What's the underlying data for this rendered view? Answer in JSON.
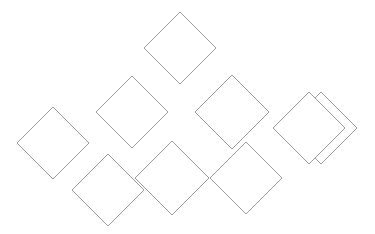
{
  "canvas": {
    "width": 375,
    "height": 234,
    "background": "#ffffff"
  },
  "style": {
    "stroke": "#9a9a9a",
    "fill": "#ffffff",
    "stroke_width": 1
  },
  "diamonds": [
    {
      "id": "top",
      "cx": 180,
      "cy": 48,
      "half": 36
    },
    {
      "id": "mid-left",
      "cx": 132,
      "cy": 112,
      "half": 36
    },
    {
      "id": "mid-right",
      "cx": 232,
      "cy": 112,
      "half": 37
    },
    {
      "id": "left",
      "cx": 53,
      "cy": 143,
      "half": 36
    },
    {
      "id": "right-back",
      "cx": 321,
      "cy": 128,
      "half": 36
    },
    {
      "id": "right-front",
      "cx": 309,
      "cy": 128,
      "half": 36
    },
    {
      "id": "bottom-left",
      "cx": 108,
      "cy": 190,
      "half": 36
    },
    {
      "id": "bottom-middle",
      "cx": 172,
      "cy": 178,
      "half": 37
    },
    {
      "id": "bottom-right",
      "cx": 246,
      "cy": 178,
      "half": 36
    }
  ]
}
